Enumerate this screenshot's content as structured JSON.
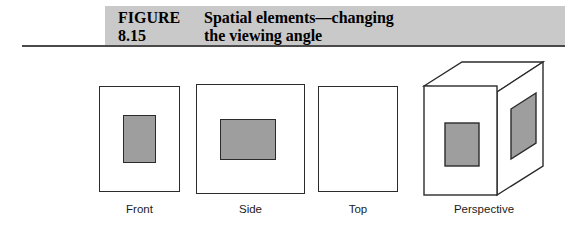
{
  "figure": {
    "caption_label": "FIGURE 8.15",
    "caption_title_line1": "Spatial elements—changing",
    "caption_title_line2": "the viewing angle",
    "banner_color": "#c9c9c9",
    "rule_color": "#4a4a4a",
    "stroke_color": "#2b2b2b",
    "fill_gray": "#9e9e9e",
    "background": "#ffffff"
  },
  "views": [
    {
      "key": "front",
      "label": "Front",
      "type": "orthographic",
      "outer_shape": "rectangle-portrait",
      "inner_shape": "rectangle-portrait",
      "has_inner": true
    },
    {
      "key": "side",
      "label": "Side",
      "type": "orthographic",
      "outer_shape": "rectangle-square",
      "inner_shape": "rectangle-landscape",
      "has_inner": true
    },
    {
      "key": "top",
      "label": "Top",
      "type": "orthographic",
      "outer_shape": "rectangle-portrait",
      "inner_shape": "none",
      "has_inner": false
    },
    {
      "key": "perspective",
      "label": "Perspective",
      "type": "axonometric-box",
      "outer_shape": "cube",
      "inner_shape": "rectangle-plus-parallelogram",
      "has_inner": true
    }
  ]
}
